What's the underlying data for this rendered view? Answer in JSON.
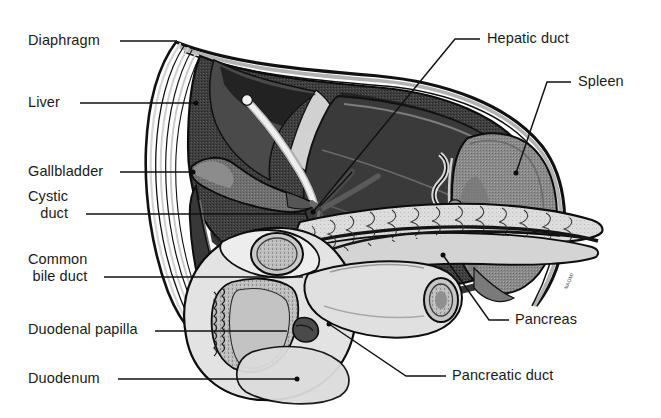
{
  "figure": {
    "width": 661,
    "height": 418,
    "background": "#ffffff",
    "signature": "NAOMI"
  },
  "palette": {
    "liver_dark": "#3f3f3f",
    "liver_shadow": "#2b2b2b",
    "liver_highlight": "#6e6e6e",
    "gallbladder": "#707070",
    "spleen": "#8a8a8a",
    "pancreas": "#d8d8d8",
    "duodenum": "#e2e2e2",
    "mucosa": "#b9b9b9",
    "diaphragm": "#9a9a9a",
    "outline": "#111111",
    "label_text": "#1a1a1a",
    "leader_line": "#111111",
    "page_background": "#ffffff"
  },
  "labels": [
    {
      "id": "diaphragm",
      "text": "Diaphragm",
      "side": "left",
      "text_x": 28,
      "text_y": 32,
      "leader": {
        "x1": 120,
        "y1": 41,
        "x2": 177,
        "y2": 41
      },
      "dot": false
    },
    {
      "id": "liver",
      "text": "Liver",
      "side": "left",
      "text_x": 28,
      "text_y": 94,
      "leader": {
        "x1": 80,
        "y1": 103,
        "x2": 196,
        "y2": 103
      },
      "dot": true
    },
    {
      "id": "gallbladder",
      "text": "Gallbladder",
      "side": "left",
      "text_x": 28,
      "text_y": 163,
      "leader": {
        "x1": 120,
        "y1": 172,
        "x2": 193,
        "y2": 172
      },
      "dot": true
    },
    {
      "id": "cystic-duct",
      "text": "Cystic\nduct",
      "line1": "Cystic",
      "line2": "duct",
      "side": "left",
      "text_x": 28,
      "text_y": 188,
      "leader": {
        "x1": 86,
        "y1": 214,
        "x2": 307,
        "y2": 214
      },
      "dot": false
    },
    {
      "id": "common-bile-duct",
      "text": "Common\nbile duct",
      "line1": "Common",
      "line2": "bile duct",
      "side": "left",
      "text_x": 28,
      "text_y": 251,
      "leader": {
        "x1": 104,
        "y1": 277,
        "x2": 303,
        "y2": 277
      },
      "dot": false
    },
    {
      "id": "duodenal-papilla",
      "text": "Duodenal papilla",
      "side": "left",
      "text_x": 28,
      "text_y": 321,
      "leader": {
        "x1": 155,
        "y1": 331,
        "x2": 287,
        "y2": 331
      },
      "dot": false
    },
    {
      "id": "duodenum",
      "text": "Duodenum",
      "side": "left",
      "text_x": 28,
      "text_y": 370,
      "leader": {
        "x1": 118,
        "y1": 379,
        "x2": 297,
        "y2": 379
      },
      "dot": true
    },
    {
      "id": "hepatic-duct",
      "text": "Hepatic duct",
      "side": "right",
      "text_x": 487,
      "text_y": 30,
      "leader_path": "M 480 39 L 455 39 L 313 212",
      "dot": true,
      "dot_x": 313,
      "dot_y": 212
    },
    {
      "id": "spleen",
      "text": "Spleen",
      "side": "right",
      "text_x": 578,
      "text_y": 73,
      "leader_path": "M 571 82 L 547 82 L 516 173",
      "dot": true,
      "dot_x": 516,
      "dot_y": 173
    },
    {
      "id": "pancreas",
      "text": "Pancreas",
      "side": "right",
      "text_x": 515,
      "text_y": 311,
      "leader_path": "M 509 320 L 489 320 L 443 255",
      "dot": true,
      "dot_x": 443,
      "dot_y": 255
    },
    {
      "id": "pancreatic-duct",
      "text": "Pancreatic duct",
      "side": "right",
      "text_x": 452,
      "text_y": 367,
      "leader_path": "M 446 376 L 406 376 L 329 324",
      "dot": true,
      "dot_x": 329,
      "dot_y": 324
    }
  ],
  "organs": [
    {
      "id": "diaphragm",
      "name": "Diaphragm"
    },
    {
      "id": "liver",
      "name": "Liver"
    },
    {
      "id": "gallbladder",
      "name": "Gallbladder"
    },
    {
      "id": "cystic-duct",
      "name": "Cystic duct"
    },
    {
      "id": "hepatic-duct",
      "name": "Hepatic duct"
    },
    {
      "id": "common-bile-duct",
      "name": "Common bile duct"
    },
    {
      "id": "spleen",
      "name": "Spleen"
    },
    {
      "id": "pancreas",
      "name": "Pancreas"
    },
    {
      "id": "pancreatic-duct",
      "name": "Pancreatic duct"
    },
    {
      "id": "duodenum",
      "name": "Duodenum"
    },
    {
      "id": "duodenal-papilla",
      "name": "Duodenal papilla"
    }
  ]
}
